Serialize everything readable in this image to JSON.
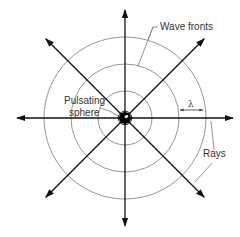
{
  "diagram": {
    "labels": {
      "wave_fronts": "Wave fronts",
      "pulsating_sphere_line1": "Pulsating",
      "pulsating_sphere_line2": "sphere",
      "wavelength": "λ",
      "rays": "Rays"
    },
    "wave_front_count": 3,
    "ray_count": 8,
    "ray_directions_deg": [
      0,
      45,
      90,
      135,
      180,
      225,
      270,
      315
    ],
    "colors": {
      "rays": "#111111",
      "wave_fronts": "#8a8a8a",
      "sphere": "#000000",
      "text": "#333333"
    }
  }
}
